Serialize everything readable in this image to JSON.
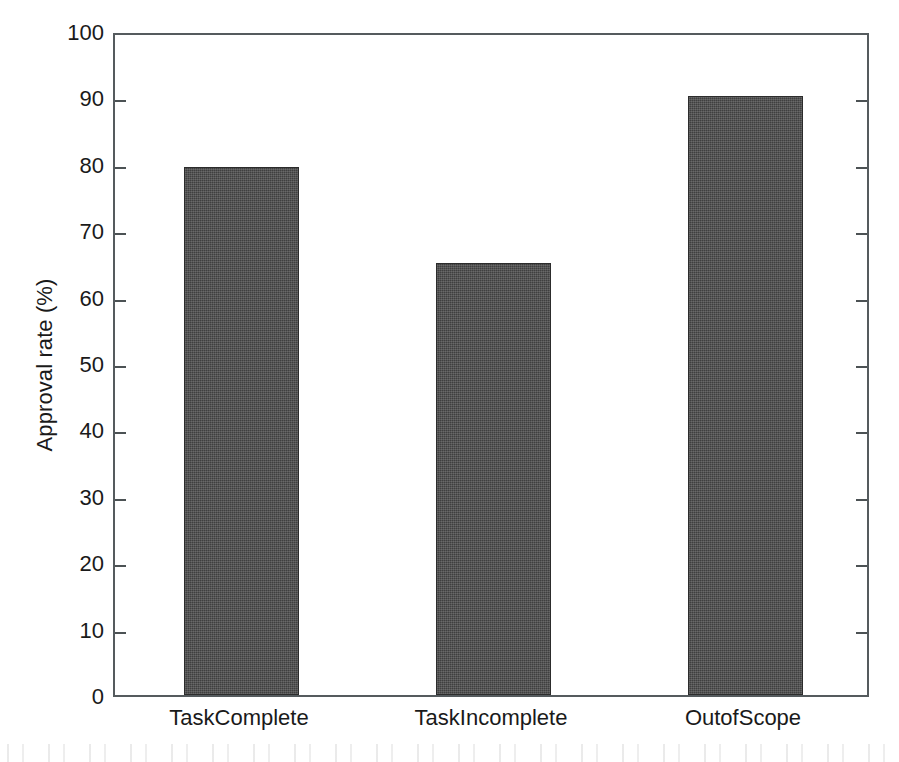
{
  "chart_data": {
    "type": "bar",
    "title": "",
    "subtitle": "",
    "xlabel": "",
    "ylabel": "Approval rate (%)",
    "categories": [
      "TaskComplete",
      "TaskIncomplete",
      "OutofScope"
    ],
    "values": [
      79.5,
      65.0,
      90.2
    ],
    "ylim": [
      0,
      100
    ],
    "yticks": [
      0,
      10,
      20,
      30,
      40,
      50,
      60,
      70,
      80,
      90,
      100
    ],
    "ytick_labels": [
      "0",
      "10",
      "20",
      "30",
      "40",
      "50",
      "60",
      "70",
      "80",
      "90",
      "100"
    ],
    "xticks": [
      "TaskComplete",
      "TaskIncomplete",
      "OutofScope"
    ],
    "grid": false,
    "legend": null,
    "legend_position": "none",
    "annotations": [],
    "series": [
      {
        "name": "Approval rate",
        "values": [
          79.5,
          65.0,
          90.2
        ]
      }
    ],
    "bar_color": "#474747",
    "bar_edge_color": "#2c2c2c",
    "axis_color": "#555b5e",
    "background_color": "#ffffff",
    "tick_direction": "in",
    "box_style": "full-box"
  },
  "axis": {
    "y_title": "Approval rate (%)",
    "y_unit": "%",
    "y_min_label": "0",
    "y_max_label": "100"
  }
}
